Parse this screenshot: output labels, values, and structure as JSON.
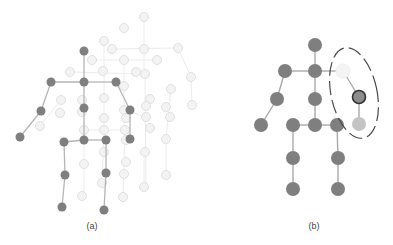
{
  "figure": {
    "panels": [
      {
        "id": "a",
        "caption": "(a)",
        "caption_pos": [
          92,
          229
        ],
        "description": "Skeleton pose with faded ghost poses of other frames in background",
        "node_color": "#7f7f7f",
        "edge_color": "#b5b5b5",
        "ghost_color": "#e4e4e4",
        "nodes": [
          {
            "name": "head",
            "x": 84,
            "y": 51
          },
          {
            "name": "neck",
            "x": 84,
            "y": 82
          },
          {
            "name": "left-shoulder",
            "x": 51,
            "y": 82
          },
          {
            "name": "right-shoulder",
            "x": 116,
            "y": 82
          },
          {
            "name": "left-elbow",
            "x": 41,
            "y": 111
          },
          {
            "name": "left-hand",
            "x": 20,
            "y": 137
          },
          {
            "name": "spine",
            "x": 84,
            "y": 108
          },
          {
            "name": "right-elbow",
            "x": 130,
            "y": 110
          },
          {
            "name": "right-hand",
            "x": 130,
            "y": 139
          },
          {
            "name": "hip-center",
            "x": 84,
            "y": 140
          },
          {
            "name": "left-hip",
            "x": 64,
            "y": 142
          },
          {
            "name": "right-hip",
            "x": 106,
            "y": 140
          },
          {
            "name": "left-knee",
            "x": 65,
            "y": 175
          },
          {
            "name": "right-knee",
            "x": 106,
            "y": 173
          },
          {
            "name": "left-foot",
            "x": 62,
            "y": 207
          },
          {
            "name": "right-foot",
            "x": 104,
            "y": 210
          }
        ],
        "edges": [
          [
            0,
            1
          ],
          [
            1,
            2
          ],
          [
            1,
            3
          ],
          [
            2,
            4
          ],
          [
            4,
            5
          ],
          [
            1,
            6
          ],
          [
            3,
            7
          ],
          [
            7,
            8
          ],
          [
            6,
            9
          ],
          [
            9,
            10
          ],
          [
            9,
            11
          ],
          [
            10,
            12
          ],
          [
            11,
            13
          ],
          [
            12,
            14
          ],
          [
            13,
            15
          ]
        ],
        "ghost_nodes": [
          [
            144,
            17
          ],
          [
            124,
            28
          ],
          [
            104,
            41
          ],
          [
            112,
            49
          ],
          [
            144,
            49
          ],
          [
            178,
            48
          ],
          [
            92,
            60
          ],
          [
            124,
            60
          ],
          [
            157,
            60
          ],
          [
            70,
            72
          ],
          [
            103,
            71
          ],
          [
            136,
            72
          ],
          [
            145,
            74
          ],
          [
            191,
            77
          ],
          [
            124,
            86
          ],
          [
            171,
            89
          ],
          [
            61,
            100
          ],
          [
            82,
            100
          ],
          [
            104,
            98
          ],
          [
            150,
            99
          ],
          [
            146,
            106
          ],
          [
            166,
            107
          ],
          [
            192,
            105
          ],
          [
            60,
            113
          ],
          [
            82,
            112
          ],
          [
            124,
            110
          ],
          [
            146,
            117
          ],
          [
            170,
            117
          ],
          [
            40,
            126
          ],
          [
            104,
            118
          ],
          [
            126,
            118
          ],
          [
            150,
            128
          ],
          [
            84,
            130
          ],
          [
            104,
            130
          ],
          [
            125,
            130
          ],
          [
            126,
            140
          ],
          [
            166,
            139
          ],
          [
            104,
            152
          ],
          [
            145,
            152
          ],
          [
            126,
            162
          ],
          [
            84,
            164
          ],
          [
            124,
            174
          ],
          [
            166,
            175
          ],
          [
            102,
            183
          ],
          [
            144,
            187
          ],
          [
            82,
            196
          ],
          [
            123,
            197
          ]
        ],
        "ghost_edges": [
          [
            [
              144,
              17
            ],
            [
              144,
              49
            ]
          ],
          [
            [
              112,
              49
            ],
            [
              178,
              48
            ]
          ],
          [
            [
              144,
              49
            ],
            [
              144,
              74
            ]
          ],
          [
            [
              92,
              60
            ],
            [
              157,
              60
            ]
          ],
          [
            [
              70,
              72
            ],
            [
              145,
              74
            ]
          ],
          [
            [
              178,
              48
            ],
            [
              191,
              77
            ]
          ],
          [
            [
              191,
              77
            ],
            [
              192,
              105
            ]
          ],
          [
            [
              104,
              41
            ],
            [
              104,
              71
            ]
          ],
          [
            [
              104,
              71
            ],
            [
              104,
              130
            ]
          ],
          [
            [
              124,
              60
            ],
            [
              124,
              130
            ]
          ],
          [
            [
              124,
              110
            ],
            [
              146,
              117
            ]
          ],
          [
            [
              145,
              74
            ],
            [
              146,
              187
            ]
          ],
          [
            [
              171,
              89
            ],
            [
              166,
              139
            ]
          ],
          [
            [
              166,
              139
            ],
            [
              166,
              175
            ]
          ],
          [
            [
              84,
              130
            ],
            [
              125,
              130
            ]
          ],
          [
            [
              84,
              130
            ],
            [
              84,
              196
            ]
          ],
          [
            [
              125,
              130
            ],
            [
              123,
              197
            ]
          ],
          [
            [
              104,
              130
            ],
            [
              102,
              183
            ]
          ],
          [
            [
              144,
              187
            ],
            [
              144,
              152
            ]
          ],
          [
            [
              61,
              100
            ],
            [
              40,
              126
            ]
          ]
        ]
      },
      {
        "id": "b",
        "caption": "(b)",
        "caption_pos": [
          314,
          229
        ],
        "description": "Skeleton with occluded right arm joints highlighted in dashed ellipse",
        "node_color": "#7f7f7f",
        "edge_color": "#aaaaaa",
        "nodes": [
          {
            "name": "head",
            "x": 315,
            "y": 45,
            "state": "normal"
          },
          {
            "name": "neck",
            "x": 315,
            "y": 71,
            "state": "normal"
          },
          {
            "name": "left-shoulder",
            "x": 285,
            "y": 71,
            "state": "normal"
          },
          {
            "name": "right-shoulder",
            "x": 343,
            "y": 71,
            "state": "missing"
          },
          {
            "name": "left-elbow",
            "x": 277,
            "y": 99,
            "state": "normal"
          },
          {
            "name": "left-hand",
            "x": 261,
            "y": 125,
            "state": "normal"
          },
          {
            "name": "spine",
            "x": 315,
            "y": 99,
            "state": "normal"
          },
          {
            "name": "right-elbow",
            "x": 359,
            "y": 97,
            "state": "selected"
          },
          {
            "name": "right-hand",
            "x": 359,
            "y": 124,
            "state": "light"
          },
          {
            "name": "hip-center",
            "x": 315,
            "y": 125,
            "state": "normal"
          },
          {
            "name": "left-hip",
            "x": 293,
            "y": 125,
            "state": "normal"
          },
          {
            "name": "right-hip",
            "x": 337,
            "y": 125,
            "state": "normal"
          },
          {
            "name": "left-knee",
            "x": 293,
            "y": 158,
            "state": "normal"
          },
          {
            "name": "right-knee",
            "x": 338,
            "y": 158,
            "state": "normal"
          },
          {
            "name": "left-foot",
            "x": 293,
            "y": 189,
            "state": "normal"
          },
          {
            "name": "right-foot",
            "x": 338,
            "y": 189,
            "state": "normal"
          }
        ],
        "edges": [
          [
            0,
            1
          ],
          [
            1,
            2
          ],
          [
            1,
            3
          ],
          [
            2,
            4
          ],
          [
            4,
            5
          ],
          [
            1,
            6
          ],
          [
            3,
            7
          ],
          [
            7,
            8
          ],
          [
            6,
            9
          ],
          [
            9,
            10
          ],
          [
            9,
            11
          ],
          [
            10,
            12
          ],
          [
            11,
            13
          ],
          [
            12,
            14
          ],
          [
            13,
            15
          ]
        ],
        "state_colors": {
          "normal": "#7f7f7f",
          "missing": "#f4f4f4",
          "selected": "#8c8c8c",
          "light": "#c4c4c4"
        },
        "highlight_ellipse": {
          "cx": 354,
          "cy": 93,
          "rx": 23,
          "ry": 46,
          "rotate": -12,
          "stroke": "#4a4a4a",
          "dash": "14 5"
        }
      }
    ]
  }
}
